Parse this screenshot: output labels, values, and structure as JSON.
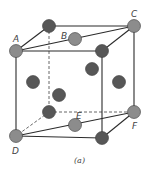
{
  "figure": {
    "caption": "(a)",
    "labels": {
      "A": "A",
      "B": "B",
      "C": "C",
      "D": "D",
      "E": "E",
      "F": "F"
    }
  },
  "colors": {
    "edge": "#2b2b2b",
    "hidden_edge": "#666666",
    "atom_dark": "#575757",
    "atom_light": "#8c8c8c",
    "atom_stroke": "#3a3a3a"
  }
}
